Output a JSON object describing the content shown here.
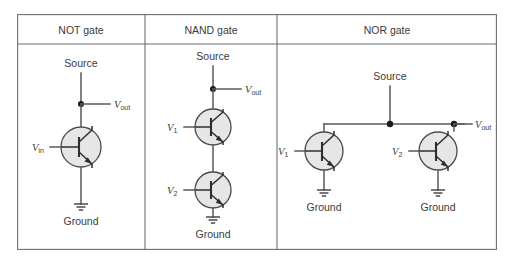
{
  "figure": {
    "type": "circuit-diagram-table",
    "columns": [
      {
        "id": "not",
        "header": "NOT gate"
      },
      {
        "id": "nand",
        "header": "NAND gate"
      },
      {
        "id": "nor",
        "header": "NOR gate"
      }
    ]
  },
  "colors": {
    "border": "#6f6f6f",
    "wire": "#595959",
    "transistor_fill": "#e6e6e6",
    "transistor_stroke": "#4a4a4a",
    "label_text": "#3a3a3a",
    "junction_dot": "#1a1a1a",
    "background": "#ffffff"
  },
  "not_gate": {
    "title": "NOT gate",
    "source_label": "Source",
    "ground_label": "Ground",
    "input": {
      "symbol": "V",
      "subscript": "in"
    },
    "output": {
      "symbol": "V",
      "subscript": "out"
    },
    "transistor_count": 1,
    "transistor_type": "NPN",
    "topology": "single"
  },
  "nand_gate": {
    "title": "NAND gate",
    "source_label": "Source",
    "ground_label": "Ground",
    "inputs": [
      {
        "symbol": "V",
        "subscript": "1"
      },
      {
        "symbol": "V",
        "subscript": "2"
      }
    ],
    "output": {
      "symbol": "V",
      "subscript": "out"
    },
    "transistor_count": 2,
    "transistor_type": "NPN",
    "topology": "series"
  },
  "nor_gate": {
    "title": "NOR gate",
    "source_label": "Source",
    "ground_labels": [
      "Ground",
      "Ground"
    ],
    "inputs": [
      {
        "symbol": "V",
        "subscript": "1"
      },
      {
        "symbol": "V",
        "subscript": "2"
      }
    ],
    "output": {
      "symbol": "V",
      "subscript": "out"
    },
    "transistor_count": 2,
    "transistor_type": "NPN",
    "topology": "parallel"
  }
}
